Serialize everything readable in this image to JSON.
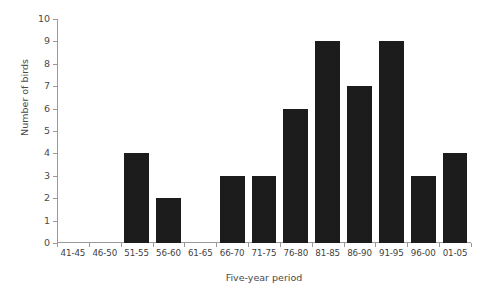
{
  "chart_data": {
    "type": "bar",
    "title": "",
    "xlabel": "Five-year period",
    "ylabel": "Number of birds",
    "categories": [
      "41-45",
      "46-50",
      "51-55",
      "56-60",
      "61-65",
      "66-70",
      "71-75",
      "76-80",
      "81-85",
      "86-90",
      "91-95",
      "96-00",
      "01-05"
    ],
    "values": [
      0,
      0,
      4,
      2,
      0,
      3,
      3,
      6,
      9,
      7,
      9,
      3,
      4
    ],
    "ylim": [
      0,
      10
    ],
    "yticks": [
      0,
      1,
      2,
      3,
      4,
      5,
      6,
      7,
      8,
      9,
      10
    ],
    "ytick_labels": [
      "0",
      "1",
      "2",
      "3",
      "4",
      "5",
      "6",
      "7",
      "8",
      "9",
      "10"
    ],
    "grid": false,
    "legend": null,
    "bar_color": "#1c1c1c",
    "axis_color": "#9a9a9a"
  }
}
